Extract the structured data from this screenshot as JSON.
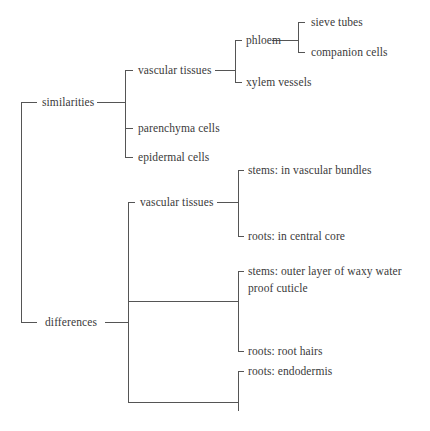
{
  "diagram": {
    "type": "tree",
    "style": {
      "line_color": "#555555",
      "text_color": "#3a3a3a",
      "background": "#ffffff"
    },
    "root": {
      "children": [
        {
          "label": "similarities",
          "children": [
            {
              "label": "vascular tissues",
              "children": [
                {
                  "label": "phloem",
                  "children": [
                    {
                      "label": "sieve tubes"
                    },
                    {
                      "label": "companion cells"
                    }
                  ]
                },
                {
                  "label": "xylem vessels"
                }
              ]
            },
            {
              "label": "parenchyma cells"
            },
            {
              "label": "epidermal cells"
            }
          ]
        },
        {
          "label": "differences",
          "children": [
            {
              "label": "vascular tissues",
              "children": [
                {
                  "label": "stems: in vascular bundles"
                },
                {
                  "label": "roots: in central core"
                }
              ]
            },
            {
              "label": "",
              "children": [
                {
                  "label": "stems: outer layer of waxy water proof cuticle"
                },
                {
                  "label": "roots: root hairs"
                }
              ]
            },
            {
              "label": "",
              "children": [
                {
                  "label": "roots: endodermis"
                }
              ]
            }
          ]
        }
      ]
    }
  },
  "labels": {
    "similarities": "similarities",
    "sim_vascular": "vascular tissues",
    "phloem": "phloem",
    "sieve": "sieve tubes",
    "companion": "companion cells",
    "xylem": "xylem vessels",
    "parenchyma": "parenchyma cells",
    "epidermal": "epidermal cells",
    "differences": "differences",
    "diff_vascular": "vascular tissues",
    "stems_bundles": "stems: in vascular bundles",
    "roots_core": "roots: in central core",
    "stems_cuticle": "stems: outer layer of waxy water proof cuticle",
    "roots_hairs": "roots: root hairs",
    "roots_endo": "roots: endodermis"
  }
}
